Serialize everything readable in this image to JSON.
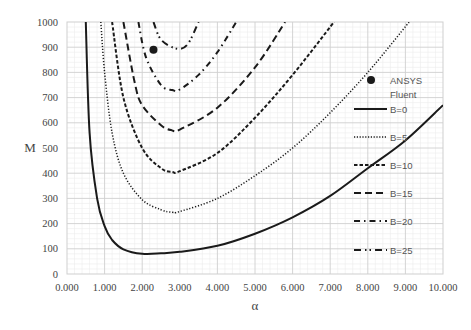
{
  "chart_data": {
    "type": "line",
    "title": "",
    "xlabel": "α",
    "ylabel": "M",
    "xlim": [
      0,
      10
    ],
    "ylim": [
      0,
      1000
    ],
    "grid": true,
    "legend_position": "inside-right",
    "x_ticks": [
      "0.000",
      "1.000",
      "2.000",
      "3.000",
      "4.000",
      "5.000",
      "6.000",
      "7.000",
      "8.000",
      "9.000",
      "10.000"
    ],
    "y_ticks": [
      "0",
      "100",
      "200",
      "300",
      "400",
      "500",
      "600",
      "700",
      "800",
      "900",
      "1000"
    ],
    "series": [
      {
        "name": "B=0",
        "style": "solid",
        "x": [
          0.5,
          0.6,
          0.8,
          1.0,
          1.2,
          1.5,
          2.0,
          2.5,
          3.0,
          4.0,
          5.0,
          6.0,
          7.0,
          8.0,
          9.0,
          10.0
        ],
        "y": [
          1000,
          560,
          300,
          190,
          135,
          98,
          80,
          82,
          88,
          112,
          160,
          225,
          310,
          420,
          530,
          670
        ]
      },
      {
        "name": "B=5",
        "style": "dotted",
        "x": [
          0.9,
          1.0,
          1.2,
          1.5,
          2.0,
          2.5,
          2.8,
          3.0,
          4.0,
          5.0,
          6.0,
          7.0,
          8.0,
          9.1
        ],
        "y": [
          1000,
          800,
          560,
          400,
          295,
          255,
          245,
          248,
          300,
          390,
          500,
          640,
          800,
          1000
        ]
      },
      {
        "name": "B=10",
        "style": "short-dash",
        "x": [
          1.2,
          1.5,
          2.0,
          2.5,
          2.8,
          3.0,
          4.0,
          5.0,
          6.0,
          7.1
        ],
        "y": [
          1000,
          700,
          500,
          420,
          405,
          408,
          480,
          620,
          790,
          1000
        ]
      },
      {
        "name": "B=15",
        "style": "long-dash",
        "x": [
          1.5,
          1.8,
          2.0,
          2.5,
          2.8,
          3.0,
          4.0,
          5.0,
          5.8
        ],
        "y": [
          1000,
          760,
          670,
          590,
          570,
          573,
          660,
          820,
          1000
        ]
      },
      {
        "name": "B=20",
        "style": "dash-dot",
        "x": [
          1.9,
          2.1,
          2.5,
          2.8,
          3.0,
          3.5,
          4.0,
          4.5
        ],
        "y": [
          1000,
          860,
          750,
          730,
          732,
          790,
          880,
          1000
        ]
      },
      {
        "name": "B=25",
        "style": "dash-dot-dot",
        "x": [
          2.3,
          2.5,
          2.9,
          3.2,
          3.5
        ],
        "y": [
          1000,
          930,
          895,
          910,
          1000
        ]
      },
      {
        "name": "ANSYS Fluent",
        "style": "marker",
        "x": [
          2.3
        ],
        "y": [
          890
        ]
      }
    ]
  },
  "legend": {
    "items": [
      {
        "label": "ANSYS",
        "label2": "Fluent",
        "style": "marker"
      },
      {
        "label": "B=0",
        "style": "solid"
      },
      {
        "label": "B=5",
        "style": "dotted"
      },
      {
        "label": "B=10",
        "style": "short-dash"
      },
      {
        "label": "B=15",
        "style": "long-dash"
      },
      {
        "label": "B=20",
        "style": "dash-dot"
      },
      {
        "label": "B=25",
        "style": "dash-dot-dot"
      }
    ]
  },
  "colors": {
    "line": "#1a1a1a",
    "major_grid": "#cfcfcf",
    "minor_grid": "#ececec",
    "text": "#444444"
  }
}
